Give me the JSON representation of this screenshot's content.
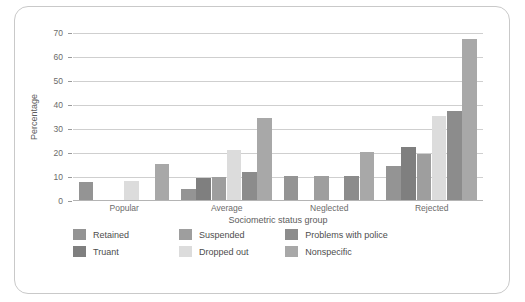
{
  "chart_data": {
    "type": "bar",
    "title": "",
    "xlabel": "Sociometric status group",
    "ylabel": "Percentage",
    "categories": [
      "Popular",
      "Average",
      "Neglected",
      "Rejected"
    ],
    "ylim": [
      0,
      70
    ],
    "yticks": [
      0,
      10,
      20,
      30,
      40,
      50,
      60,
      70
    ],
    "grid": true,
    "legend_position": "bottom-left",
    "series": [
      {
        "name": "Retained",
        "color": "#949494",
        "values": [
          7.5,
          4.5,
          10.0,
          14.0
        ]
      },
      {
        "name": "Truant",
        "color": "#7f7f7f",
        "values": [
          0.0,
          9.0,
          0.0,
          22.0
        ]
      },
      {
        "name": "Suspended",
        "color": "#9e9e9e",
        "values": [
          0.0,
          9.5,
          10.0,
          19.0
        ]
      },
      {
        "name": "Dropped out",
        "color": "#dcdcdc",
        "values": [
          8.0,
          21.0,
          0.0,
          35.0
        ]
      },
      {
        "name": "Problems with police",
        "color": "#8c8c8c",
        "values": [
          0.0,
          11.5,
          10.0,
          37.0
        ]
      },
      {
        "name": "Nonspecific",
        "color": "#a8a8a8",
        "values": [
          15.0,
          34.0,
          20.0,
          67.0
        ]
      }
    ]
  },
  "legend": {
    "rows": [
      [
        {
          "label": "Retained",
          "color": "#949494"
        },
        {
          "label": "Suspended",
          "color": "#9e9e9e"
        },
        {
          "label": "Problems with police",
          "color": "#8c8c8c"
        }
      ],
      [
        {
          "label": "Truant",
          "color": "#7f7f7f"
        },
        {
          "label": "Dropped out",
          "color": "#dcdcdc"
        },
        {
          "label": "Nonspecific",
          "color": "#a8a8a8"
        }
      ]
    ]
  }
}
